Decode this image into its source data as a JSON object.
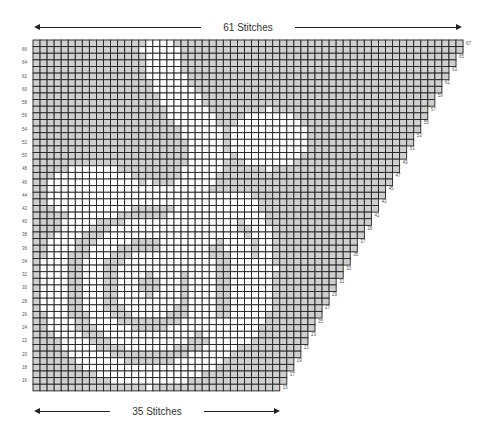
{
  "top_dimension": {
    "label": "61 Stitches",
    "stitches": 61
  },
  "bottom_dimension": {
    "label": "35 Stitches",
    "stitches": 35
  },
  "chart": {
    "first_row": 15,
    "last_row": 67,
    "bottom_row_width": 35,
    "top_row_width": 61,
    "increase_rule": "1 stitch every 2 rows at right edge",
    "left_row_labels": [
      66,
      64,
      62,
      60,
      58,
      56,
      54,
      52,
      50,
      48,
      46,
      44,
      42,
      40,
      38,
      36,
      34,
      32,
      30,
      28,
      26,
      24,
      22,
      20,
      18,
      16
    ],
    "right_row_labels": [
      67,
      65,
      63,
      61,
      59,
      57,
      55,
      53,
      51,
      49,
      47,
      45,
      43,
      41,
      39,
      37,
      35,
      33,
      31,
      29,
      27,
      25,
      23,
      21,
      19,
      17,
      15
    ]
  },
  "colors": {
    "contrast": "#cfcfcf",
    "main": "#ffffff",
    "gridline": "#222222"
  },
  "motif_shapes": {
    "rose_center": {
      "col": 16.5,
      "row": 30.5
    },
    "outer_disc": {
      "rx": 15.5,
      "ry": 15.5
    },
    "rings": [
      {
        "r_in": 10.0,
        "r_out": 12.0
      },
      {
        "r_in": 5.0,
        "r_out": 7.0
      },
      {
        "r_in": 0.0,
        "r_out": 1.6
      }
    ],
    "stem": {
      "points": [
        [
          18,
          66
        ],
        [
          19,
          62
        ],
        [
          21,
          58
        ],
        [
          24,
          54
        ],
        [
          25,
          50
        ],
        [
          23,
          46
        ]
      ],
      "half_width": 2.6
    },
    "petal_blob": {
      "col": 33.5,
      "row": 52.5,
      "rx": 5.5,
      "ry": 4.5
    },
    "leaf": {
      "col": 8.5,
      "row": 44.5,
      "rx": 6.5,
      "ry": 4.0
    },
    "right_sweep": {
      "col": 28.0,
      "row": 33.0,
      "rx": 6.5,
      "ry": 12.0
    }
  }
}
